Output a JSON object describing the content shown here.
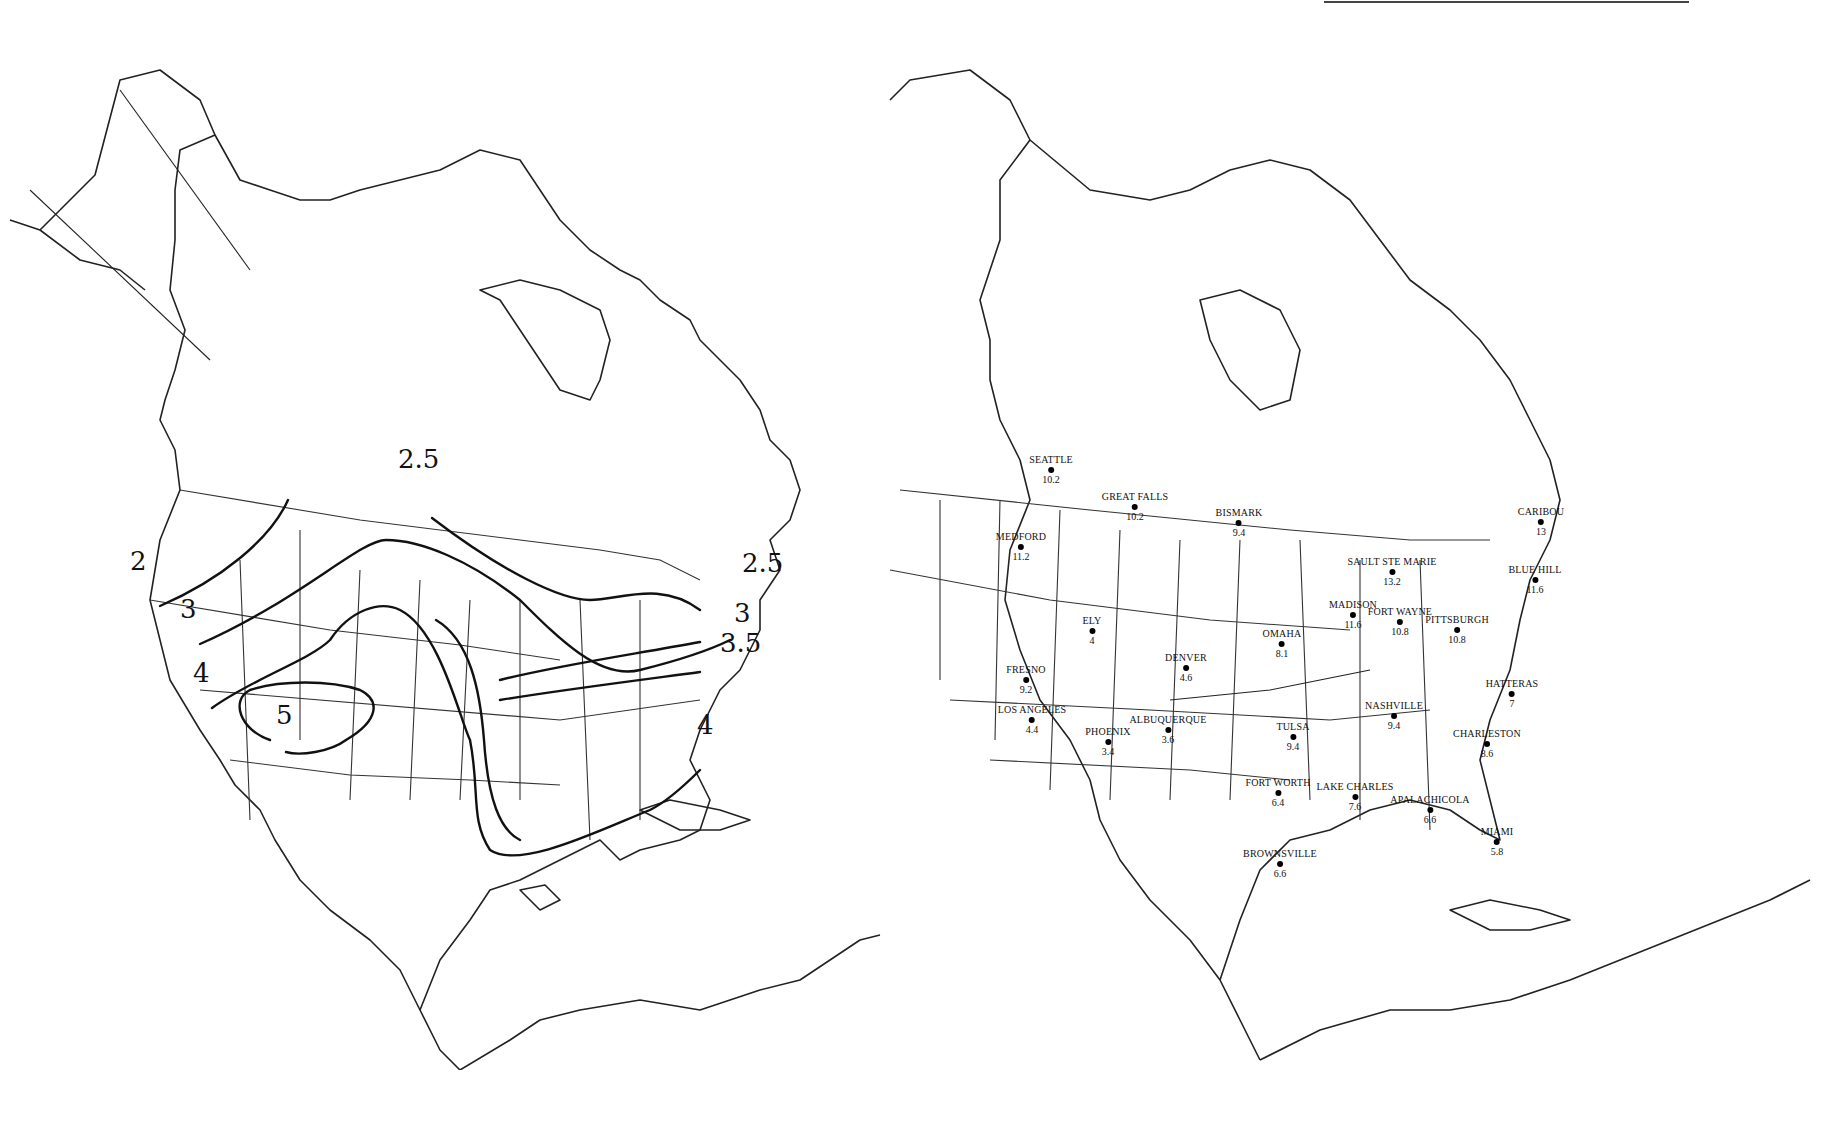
{
  "figure": {
    "left_map": {
      "description": "Isoline map of North America with contour lines over the contiguous United States",
      "contour_labels": [
        {
          "value": "2",
          "x": 130,
          "y": 548
        },
        {
          "value": "2.5",
          "x": 398,
          "y": 446
        },
        {
          "value": "2.5",
          "x": 742,
          "y": 550
        },
        {
          "value": "3",
          "x": 180,
          "y": 596
        },
        {
          "value": "3",
          "x": 734,
          "y": 600
        },
        {
          "value": "3.5",
          "x": 720,
          "y": 630
        },
        {
          "value": "4",
          "x": 193,
          "y": 660
        },
        {
          "value": "4",
          "x": 697,
          "y": 712
        },
        {
          "value": "5",
          "x": 276,
          "y": 702
        }
      ]
    },
    "right_map": {
      "description": "Station map of the contiguous United States with city names and values",
      "stations": [
        {
          "name": "SEATTLE",
          "value": "10.2",
          "x": 261,
          "y": 428
        },
        {
          "name": "GREAT FALLS",
          "value": "10.2",
          "x": 345,
          "y": 465
        },
        {
          "name": "BISMARK",
          "value": "9.4",
          "x": 449,
          "y": 481
        },
        {
          "name": "MEDFORD",
          "value": "11.2",
          "x": 231,
          "y": 505
        },
        {
          "name": "SAULT STE MARIE",
          "value": "13.2",
          "x": 602,
          "y": 530
        },
        {
          "name": "CARIBOU",
          "value": "13",
          "x": 751,
          "y": 480
        },
        {
          "name": "BLUE HILL",
          "value": "11.6",
          "x": 745,
          "y": 538
        },
        {
          "name": "MADISON",
          "value": "11.6",
          "x": 563,
          "y": 573
        },
        {
          "name": "PITTSBURGH",
          "value": "10.8",
          "x": 667,
          "y": 588
        },
        {
          "name": "FORT WAYNE",
          "value": "10.8",
          "x": 610,
          "y": 580
        },
        {
          "name": "ELY",
          "value": "4",
          "x": 302,
          "y": 589
        },
        {
          "name": "OMAHA",
          "value": "8.1",
          "x": 492,
          "y": 602
        },
        {
          "name": "DENVER",
          "value": "4.6",
          "x": 396,
          "y": 626
        },
        {
          "name": "FRESNO",
          "value": "9.2",
          "x": 236,
          "y": 638
        },
        {
          "name": "HATTERAS",
          "value": "7",
          "x": 722,
          "y": 652
        },
        {
          "name": "LOS ANGELES",
          "value": "4.4",
          "x": 242,
          "y": 678
        },
        {
          "name": "NASHVILLE",
          "value": "9.4",
          "x": 604,
          "y": 674
        },
        {
          "name": "ALBUQUERQUE",
          "value": "3.6",
          "x": 378,
          "y": 688
        },
        {
          "name": "PHOENIX",
          "value": "3.4",
          "x": 318,
          "y": 700
        },
        {
          "name": "TULSA",
          "value": "9.4",
          "x": 503,
          "y": 695
        },
        {
          "name": "CHARLESTON",
          "value": "8.6",
          "x": 697,
          "y": 702
        },
        {
          "name": "FORT WORTH",
          "value": "6.4",
          "x": 488,
          "y": 751
        },
        {
          "name": "LAKE CHARLES",
          "value": "7.6",
          "x": 565,
          "y": 755
        },
        {
          "name": "APALACHICOLA",
          "value": "6.6",
          "x": 640,
          "y": 768
        },
        {
          "name": "MIAMI",
          "value": "5.8",
          "x": 707,
          "y": 800
        },
        {
          "name": "BROWNSVILLE",
          "value": "6.6",
          "x": 490,
          "y": 822
        }
      ]
    },
    "captions": {
      "left": "",
      "right": ""
    }
  }
}
